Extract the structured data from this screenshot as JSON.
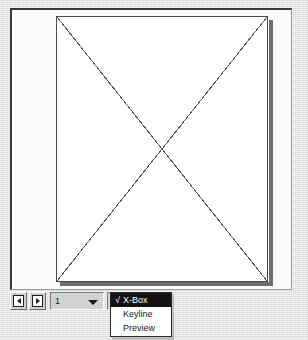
{
  "window": {
    "background_color": "#d8d8d8",
    "canvas_background": "#ffffff"
  },
  "canvas": {
    "name": "document-preview",
    "page": {
      "label": "page-sheet",
      "placeholder_graphic": "x-box",
      "border_color": "#4a4a4a",
      "shadow_color": "#6e6e6e",
      "cross_lines": [
        {
          "x1": 0,
          "y1": 0,
          "x2": 212,
          "y2": 266
        },
        {
          "x1": 212,
          "y1": 0,
          "x2": 0,
          "y2": 266
        }
      ]
    }
  },
  "status_bar": {
    "prev_page_button": {
      "icon": "previous-page-icon",
      "label": ""
    },
    "next_page_button": {
      "icon": "next-page-icon",
      "label": ""
    },
    "page_number": {
      "value": "1",
      "placeholder": "1",
      "arrow_icon": "chevron-down-icon"
    },
    "view_mode": {
      "value": "X-",
      "full_value": "X-Box"
    }
  },
  "view_menu": {
    "open": true,
    "items": [
      {
        "label": "X-Box",
        "checked": true,
        "check_glyph": "√"
      },
      {
        "label": "Keyline",
        "checked": false,
        "check_glyph": ""
      },
      {
        "label": "Preview",
        "checked": false,
        "check_glyph": ""
      }
    ]
  }
}
